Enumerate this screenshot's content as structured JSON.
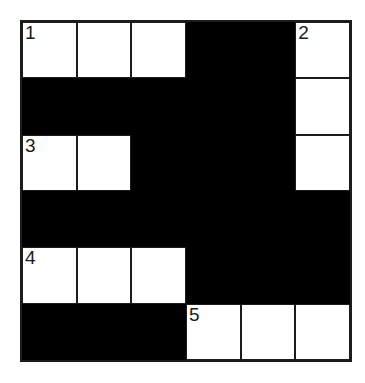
{
  "puzzle": {
    "kind": "crossword-grid",
    "rows": 6,
    "cols": 6,
    "colors": {
      "block": "#000000",
      "cell": "#ffffff",
      "line": "#1c1c1c",
      "background": "#ffffff",
      "number": "#1a1a1a"
    },
    "clue_numbers": [
      "1",
      "2",
      "3",
      "4",
      "5"
    ],
    "cells": [
      [
        "1",
        "",
        "",
        "#",
        "#",
        "2"
      ],
      [
        "#",
        "#",
        "#",
        "#",
        "#",
        ""
      ],
      [
        "3",
        "",
        "#",
        "#",
        "#",
        ""
      ],
      [
        "#",
        "#",
        "#",
        "#",
        "#",
        "#"
      ],
      [
        "4",
        "",
        "",
        "#",
        "#",
        "#"
      ],
      [
        "#",
        "#",
        "#",
        "5",
        "",
        ""
      ]
    ]
  }
}
